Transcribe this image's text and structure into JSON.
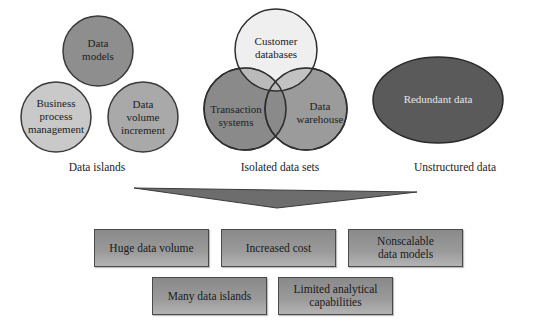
{
  "groups": {
    "data_islands": {
      "caption": "Data islands",
      "circles": [
        {
          "label_lines": [
            "Data",
            "models"
          ]
        },
        {
          "label_lines": [
            "Business",
            "process",
            "management"
          ]
        },
        {
          "label_lines": [
            "Data",
            "volume",
            "increment"
          ]
        }
      ]
    },
    "isolated_data_sets": {
      "caption": "Isolated data sets",
      "circles": [
        {
          "label_lines": [
            "Customer",
            "databases"
          ]
        },
        {
          "label_lines": [
            "Transaction",
            "systems"
          ]
        },
        {
          "label_lines": [
            "Data",
            "warehouse"
          ]
        }
      ]
    },
    "unstructured_data": {
      "caption": "Unstructured data",
      "ellipse": {
        "label": "Redundant data"
      }
    }
  },
  "outcomes": {
    "row1": [
      {
        "label_lines": [
          "Huge data volume"
        ]
      },
      {
        "label_lines": [
          "Increased cost"
        ]
      },
      {
        "label_lines": [
          "Nonscalable",
          "data models"
        ]
      }
    ],
    "row2": [
      {
        "label_lines": [
          "Many data islands"
        ]
      },
      {
        "label_lines": [
          "Limited analytical",
          "capabilities"
        ]
      }
    ]
  },
  "colors": {
    "circle_dark": "#8c8c8c",
    "circle_mid": "#a8a8a8",
    "circle_light": "#cfcfcf",
    "circle_lightest": "#e0e0e0",
    "ellipse": "#595959",
    "funnel": "#6e6e6e",
    "stroke": "#333333"
  }
}
